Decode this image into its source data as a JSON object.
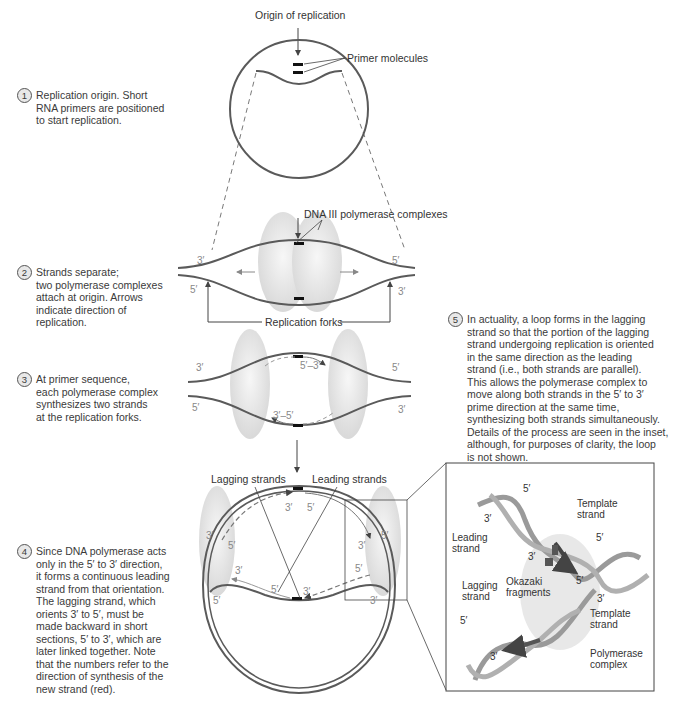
{
  "colors": {
    "strand": "#5a5a5a",
    "polymerase": "#e6e6e6",
    "new_strand": "#c8c8c8",
    "text": "#333333",
    "end_label": "#888888"
  },
  "labels": {
    "origin": "Origin of replication",
    "primers": "Primer molecules",
    "dna_pol": "DNA III polymerase complexes",
    "forks": "Replication forks",
    "lagging": "Lagging strands",
    "leading": "Leading strands"
  },
  "steps": [
    {
      "num": "1",
      "text": "Replication origin. Short\nRNA primers are positioned\nto start replication."
    },
    {
      "num": "2",
      "text": "Strands separate;\ntwo polymerase complexes\nattach at origin. Arrows\nindicate direction of\nreplication."
    },
    {
      "num": "3",
      "text": "At primer sequence,\neach polymerase complex\nsynthesizes two strands\nat the replication forks."
    },
    {
      "num": "4",
      "text": "Since DNA polymerase acts\nonly in the 5′ to 3′ direction,\nit forms a continuous leading\nstrand from that orientation.\nThe lagging strand, which\norients 3′ to 5′, must be\nmade backward in short\nsections, 5′ to 3′, which are\nlater linked together. Note\nthat the numbers refer to the\ndirection of synthesis of the\nnew strand (red)."
    },
    {
      "num": "5",
      "text": "In actuality, a loop forms in the lagging\nstrand so that the portion of the lagging\nstrand undergoing replication is oriented\nin the same direction as the leading\nstrand (i.e., both strands are parallel).\nThis allows the polymerase complex to\nmove along both strands in the 5′ to 3′\nprime direction at the same time,\nsynthesizing both strands simultaneously.\nDetails of the process are seen in the inset,\nalthough, for purposes of clarity, the loop\nis not shown."
    }
  ],
  "ends": {
    "s2": [
      "3′",
      "5′",
      "5′",
      "3′"
    ],
    "s3": [
      "3′",
      "5′",
      "5′",
      "3′",
      "5′–3′",
      "3′–5′"
    ],
    "s4": [
      "3′",
      "5′",
      "3′",
      "5′",
      "3′",
      "5′",
      "3′",
      "5′",
      "5′",
      "3′",
      "5′",
      "3′",
      "5′",
      "3′"
    ]
  },
  "inset": {
    "labels": [
      "5′",
      "3′",
      "Template\nstrand",
      "Leading\nstrand",
      "3′",
      "5′",
      "5′",
      "Okazaki\nfragments",
      "Lagging\nstrand",
      "3′",
      "Template\nstrand",
      "5′",
      "3′",
      "Polymerase\ncomplex"
    ]
  }
}
